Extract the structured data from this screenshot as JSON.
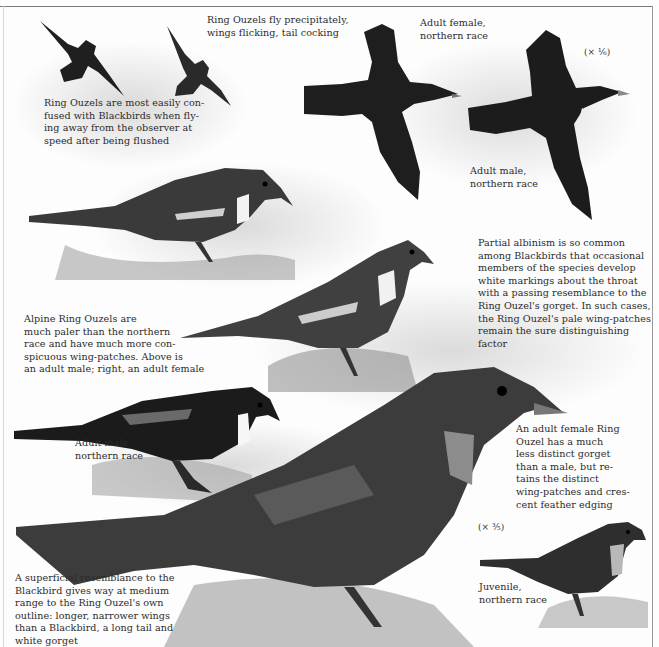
{
  "plate": {
    "subject": "Ring Ouzel identification plate",
    "colors": {
      "background": "#fdfdfd",
      "frame": "#7a7a7a",
      "ink": "#2b2b2b",
      "bird_dark": "#1e1e1e",
      "bird_mid": "#4a4a4a",
      "grass": "#8a8a8a"
    }
  },
  "captions": {
    "flight_confusion": "Ring Ouzels are most easily con-\nfused with Blackbirds when fly-\ning away from the observer at\nspeed after being flushed",
    "flight_style": "Ring Ouzels fly precipitately,\nwings flicking, tail cocking",
    "adult_female_flight": "Adult female,\nnorthern race",
    "adult_male_flight": "Adult male,\nnorthern race",
    "scale_top": "(× ⅙)",
    "albinism": "Partial albinism is so common\namong Blackbirds that occasional\nmembers of the species develop\nwhite markings about the throat\nwith a passing resemblance to the\nRing Ouzel's gorget. In such cases,\nthe Ring Ouzel's pale wing-patches\nremain the sure distinguishing\nfactor",
    "alpine": "Alpine Ring Ouzels are\nmuch paler than the northern\nrace and have much more con-\nspicuous wing-patches. Above is\nan adult male; right, an adult female",
    "adult_male_perched": "Adult male,\nnorthern race",
    "adult_female_large": "An adult female Ring\nOuzel has a much\nless distinct gorget\nthan a male, but re-\ntains the distinct\nwing-patches and cres-\ncent feather edging",
    "scale_bottom": "(× ⅗)",
    "juvenile": "Juvenile,\nnorthern race",
    "outline": "A superficial resemblance to the\nBlackbird gives way at medium\nrange to the Ring Ouzel's own\noutline: longer, narrower wings\nthan a Blackbird, a long tail and\nwhite gorget"
  },
  "illustrations": [
    {
      "id": "flying-silhouette-1",
      "label": "flying bird silhouette"
    },
    {
      "id": "flying-silhouette-2",
      "label": "flying bird silhouette"
    },
    {
      "id": "adult-female-flight",
      "label": "adult female in flight"
    },
    {
      "id": "adult-male-flight",
      "label": "adult male in flight"
    },
    {
      "id": "alpine-male",
      "label": "alpine adult male perched"
    },
    {
      "id": "alpine-female",
      "label": "alpine adult female perched"
    },
    {
      "id": "adult-male-perched",
      "label": "adult male northern race perched"
    },
    {
      "id": "adult-female-large",
      "label": "adult female large figure"
    },
    {
      "id": "juvenile",
      "label": "juvenile northern race"
    }
  ]
}
